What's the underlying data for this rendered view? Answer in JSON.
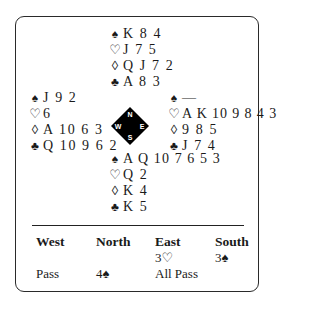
{
  "deal": {
    "north": {
      "spades": "K 8 4",
      "hearts": "J 7 5",
      "diamonds": "Q J 7 2",
      "clubs": "A 8 3"
    },
    "west": {
      "spades": "J 9 2",
      "hearts": "6",
      "diamonds": "A 10 6 3",
      "clubs": "Q 10 9 6 2"
    },
    "east": {
      "spades": "—",
      "hearts": "A K 10 9 8 4 3",
      "diamonds": "9 8 5",
      "clubs": "J 7 4"
    },
    "south": {
      "spades": "A Q 10 7 6 5 3",
      "hearts": "Q 2",
      "diamonds": "K 4",
      "clubs": "K 5"
    }
  },
  "suits": {
    "spades": "♠",
    "hearts": "♡",
    "diamonds": "◊",
    "clubs": "♣"
  },
  "compass": {
    "n": "N",
    "e": "E",
    "s": "S",
    "w": "W",
    "fill": "#000000"
  },
  "bidding": {
    "headers": [
      "West",
      "North",
      "East",
      "South"
    ],
    "rows": [
      [
        "",
        "",
        "3♡",
        "3♠"
      ],
      [
        "Pass",
        "4♠",
        "All Pass",
        ""
      ]
    ]
  }
}
